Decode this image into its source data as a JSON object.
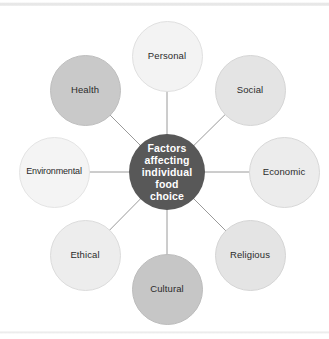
{
  "diagram": {
    "type": "radial-hub-and-spoke",
    "center": {
      "id": "center-hub",
      "label": "Factors\naffecting\nindividual\nfood\nchoice",
      "lines": [
        "Factors",
        "affecting",
        "individual",
        "food",
        "choice"
      ],
      "fill": "#585858",
      "text_color": "#ffffff"
    },
    "nodes": [
      {
        "id": "personal",
        "label": "Personal",
        "fill": "#f3f3f3",
        "stroke": "#e0e0e0",
        "angle_deg": -90,
        "cx": 167,
        "cy": 56
      },
      {
        "id": "social",
        "label": "Social",
        "fill": "#e4e4e4",
        "stroke": "#d5d5d5",
        "angle_deg": -45,
        "cx": 250,
        "cy": 90
      },
      {
        "id": "economic",
        "label": "Economic",
        "fill": "#ececec",
        "stroke": "#d8d8d8",
        "angle_deg": 0,
        "cx": 284,
        "cy": 172
      },
      {
        "id": "religious",
        "label": "Religious",
        "fill": "#e4e4e4",
        "stroke": "#d5d5d5",
        "angle_deg": 45,
        "cx": 250,
        "cy": 255
      },
      {
        "id": "cultural",
        "label": "Cultural",
        "fill": "#c6c6c6",
        "stroke": "#bcbcbc",
        "angle_deg": 90,
        "cx": 167,
        "cy": 289
      },
      {
        "id": "ethical",
        "label": "Ethical",
        "fill": "#ededed",
        "stroke": "#dcdcdc",
        "angle_deg": 135,
        "cx": 85,
        "cy": 255
      },
      {
        "id": "environmental",
        "label": "Environmental",
        "fill": "#f4f4f4",
        "stroke": "#e4e4e4",
        "angle_deg": 180,
        "cx": 54,
        "cy": 172
      },
      {
        "id": "health",
        "label": "Health",
        "fill": "#c9c9c9",
        "stroke": "#bebebe",
        "angle_deg": -135,
        "cx": 85,
        "cy": 90
      }
    ],
    "connectors": {
      "color": "#9a9a9a",
      "width_px": 1,
      "count": 8
    },
    "background": "#ffffff"
  }
}
